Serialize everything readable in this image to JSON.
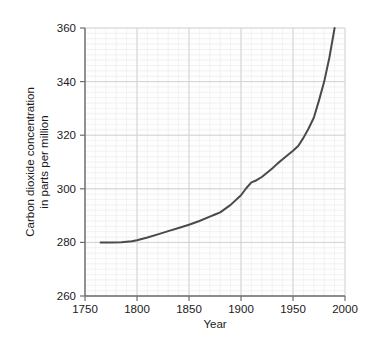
{
  "chart_data": {
    "type": "line",
    "title": "",
    "xlabel": "Year",
    "ylabel": "Carbon dioxide concentration in parts per million",
    "ylabel_lines": [
      "Carbon dioxide concentration",
      "in parts per million"
    ],
    "xlim": [
      1750,
      2000
    ],
    "ylim": [
      260,
      360
    ],
    "xticks": [
      1750,
      1800,
      1850,
      1900,
      1950,
      2000
    ],
    "xtick_labels": [
      "1750",
      "1800",
      "1850",
      "1900",
      "1950",
      "2000"
    ],
    "yticks": [
      260,
      280,
      300,
      320,
      340,
      360
    ],
    "ytick_labels": [
      "260",
      "280",
      "300",
      "320",
      "340",
      "360"
    ],
    "x_minor_step": 10,
    "y_minor_step": 2,
    "grid": true,
    "grid_minor": true,
    "legend": "none",
    "series": [
      {
        "name": "Carbon dioxide concentration",
        "color": "#4a4a4a",
        "line_width": 2,
        "x": [
          1765,
          1775,
          1785,
          1795,
          1800,
          1810,
          1820,
          1830,
          1840,
          1850,
          1860,
          1870,
          1875,
          1880,
          1890,
          1900,
          1905,
          1910,
          1915,
          1920,
          1925,
          1930,
          1935,
          1940,
          1945,
          1950,
          1955,
          1960,
          1965,
          1970,
          1975,
          1980,
          1985,
          1990
        ],
        "y": [
          280.0,
          280.0,
          280.1,
          280.4,
          280.8,
          281.8,
          283.0,
          284.2,
          285.4,
          286.6,
          288.0,
          289.6,
          290.4,
          291.2,
          294.0,
          297.6,
          300.2,
          302.4,
          303.2,
          304.4,
          306.0,
          307.6,
          309.4,
          311.0,
          312.6,
          314.2,
          316.0,
          319.0,
          322.5,
          326.5,
          333.0,
          340.0,
          349.0,
          360.0
        ]
      }
    ]
  },
  "axes": {
    "x_axis_name": "year-axis",
    "y_axis_name": "co2-concentration-axis"
  }
}
